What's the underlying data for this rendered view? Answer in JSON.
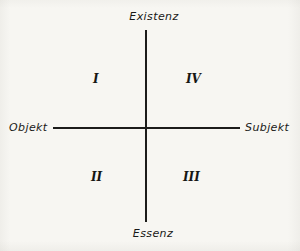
{
  "diagram": {
    "type": "cartesian-quadrant-diagram",
    "background_color": "#f7f6f2",
    "line_color": "#1c1c1a",
    "text_color": "#191917",
    "axes": {
      "vertical": {
        "top_label": "Existenz",
        "bottom_label": "Essenz"
      },
      "horizontal": {
        "left_label": "Objekt",
        "right_label": "Subjekt"
      }
    },
    "quadrants": [
      {
        "position": "upper-left",
        "numeral": "I"
      },
      {
        "position": "upper-right",
        "numeral": "IV"
      },
      {
        "position": "lower-left",
        "numeral": "II"
      },
      {
        "position": "lower-right",
        "numeral": "III"
      }
    ]
  },
  "chart_data": {
    "type": "scatter",
    "title": "",
    "xlabel": "Objekt — Subjekt",
    "ylabel": "Essenz — Existenz",
    "grid": false,
    "legend": null,
    "xlim": [
      -1,
      1
    ],
    "ylim": [
      -1,
      1
    ],
    "axis_tick_labels": {
      "x_left": "Objekt",
      "x_right": "Subjekt",
      "y_top": "Existenz",
      "y_bottom": "Essenz"
    },
    "annotations": [
      {
        "text": "I",
        "x": -0.5,
        "y": 0.55,
        "quadrant": "upper-left"
      },
      {
        "text": "IV",
        "x": 0.5,
        "y": 0.55,
        "quadrant": "upper-right"
      },
      {
        "text": "II",
        "x": -0.5,
        "y": -0.5,
        "quadrant": "lower-left"
      },
      {
        "text": "III",
        "x": 0.5,
        "y": -0.5,
        "quadrant": "lower-right"
      }
    ],
    "values": []
  }
}
